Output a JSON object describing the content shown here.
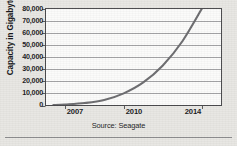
{
  "chart_data": {
    "type": "line",
    "title": "",
    "subtitle": "",
    "xlabel": "",
    "ylabel": "Capacity in Gigabytes",
    "source_note": "Source: Seagate",
    "grid": true,
    "legend": null,
    "xlim": [
      2006,
      2015
    ],
    "ylim": [
      0,
      80000
    ],
    "x_ticks": [
      2007,
      2010,
      2014
    ],
    "x_tick_labels": [
      "2007",
      "2010",
      "2014"
    ],
    "y_ticks": [
      0,
      10000,
      20000,
      30000,
      40000,
      50000,
      60000,
      70000,
      80000
    ],
    "y_tick_labels": [
      "0",
      "10,000",
      "20,000",
      "30,000",
      "40,000",
      "50,000",
      "60,000",
      "70,000",
      "80,000"
    ],
    "series": [
      {
        "name": "Hard drive capacity",
        "x": [
          2006.4,
          2007,
          2008,
          2009,
          2010,
          2011,
          2012,
          2013,
          2014
        ],
        "values": [
          300,
          800,
          2000,
          4500,
          10000,
          19000,
          33000,
          53000,
          80000
        ]
      }
    ],
    "line_color": "#6d6d70",
    "grid_color": "#9a9a9c",
    "plot_background": "#fbfbfa",
    "frame_color": "#4a4a4d"
  },
  "axes": {
    "y_title": "Capacity in Gigabytes"
  },
  "caption": {
    "source": "Source: Seagate"
  }
}
